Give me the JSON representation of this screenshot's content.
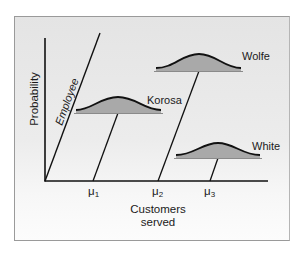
{
  "diagram": {
    "axes": {
      "y_label": "Probability",
      "x_label_line1": "Customers",
      "x_label_line2": "served"
    },
    "employee_axis_label": "Employee",
    "distributions": [
      {
        "name": "Korosa",
        "mean_label": "μ",
        "mean_sub": "1"
      },
      {
        "name": "Wolfe",
        "mean_label": "μ",
        "mean_sub": "2"
      },
      {
        "name": "White",
        "mean_label": "μ",
        "mean_sub": "3"
      }
    ],
    "colors": {
      "curve_fill": "#a9a9a9",
      "curve_stroke": "#111111",
      "base_line": "#8a8a8a",
      "axis": "#111111",
      "background": "#e9e9e9"
    }
  }
}
